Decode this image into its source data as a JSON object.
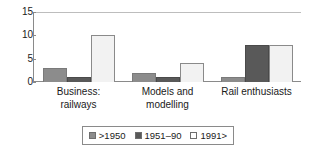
{
  "chart_data": {
    "type": "bar",
    "title": "",
    "subtitle": "",
    "xlabel": "",
    "ylabel": "",
    "ylim": [
      0,
      15
    ],
    "yticks": [
      0,
      5,
      10,
      15
    ],
    "grid": false,
    "legend_position": "bottom",
    "categories": [
      "Business:\nrailways",
      "Models and\nmodelling",
      "Rail enthusiasts"
    ],
    "series": [
      {
        "name": ">1950",
        "color": "#8C8C8C",
        "values": [
          3,
          2,
          1
        ]
      },
      {
        "name": "1951–90",
        "color": "#595959",
        "values": [
          1,
          1,
          8
        ]
      },
      {
        "name": "1991>",
        "color": "#F2F2F2",
        "values": [
          10,
          4,
          8
        ]
      }
    ]
  },
  "axis": {
    "y_tick_labels": [
      "15",
      "10",
      "5",
      "0"
    ]
  },
  "legend": {
    "entries": [
      ">1950",
      "1951–90",
      "1991>"
    ]
  }
}
